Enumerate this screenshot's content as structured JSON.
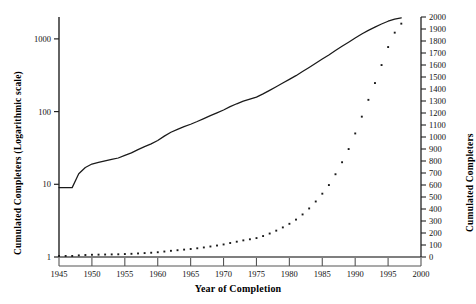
{
  "chart_data": {
    "type": "line",
    "title": "",
    "xlabel": "Year of Completion",
    "ylabel_left": "Cumulated Completers (Logarithmic scale)",
    "ylabel_right": "Cumulated Completers",
    "xlim": [
      1945,
      2000
    ],
    "xticks": [
      1945,
      1950,
      1955,
      1960,
      1965,
      1970,
      1975,
      1980,
      1985,
      1990,
      1995,
      2000
    ],
    "xticklabels": [
      "1945",
      "1950",
      "1955",
      "1960",
      "1965",
      "1970",
      "1975",
      "1980",
      "1985",
      "1990",
      "1995",
      "2000"
    ],
    "left_axis": {
      "scale": "log",
      "ylim": [
        1,
        2000
      ],
      "yticks": [
        1,
        10,
        100,
        1000
      ],
      "yticklabels": [
        "1",
        "10",
        "100",
        "1000"
      ]
    },
    "right_axis": {
      "scale": "linear",
      "ylim": [
        0,
        2000
      ],
      "yticks": [
        0,
        100,
        200,
        300,
        400,
        500,
        600,
        700,
        800,
        900,
        1000,
        1100,
        1200,
        1300,
        1400,
        1500,
        1600,
        1700,
        1800,
        1900,
        2000
      ],
      "yticklabels": [
        "0",
        "100",
        "200",
        "300",
        "400",
        "500",
        "600",
        "700",
        "800",
        "900",
        "1000",
        "1100",
        "1200",
        "1300",
        "1400",
        "1500",
        "1600",
        "1700",
        "1800",
        "1900",
        "2000"
      ]
    },
    "grid": false,
    "legend": null,
    "series": [
      {
        "name": "Cumulated Completers (log scale, solid line)",
        "style": "line",
        "axis": "left",
        "color": "#1a1a1a",
        "x": [
          1945,
          1946,
          1947,
          1948,
          1949,
          1950,
          1951,
          1952,
          1953,
          1954,
          1955,
          1956,
          1957,
          1958,
          1959,
          1960,
          1961,
          1962,
          1963,
          1964,
          1965,
          1966,
          1967,
          1968,
          1969,
          1970,
          1971,
          1972,
          1973,
          1974,
          1975,
          1976,
          1977,
          1978,
          1979,
          1980,
          1981,
          1982,
          1983,
          1984,
          1985,
          1986,
          1987,
          1988,
          1989,
          1990,
          1991,
          1992,
          1993,
          1994,
          1995,
          1996,
          1997
        ],
        "values": [
          9,
          9,
          9,
          14,
          17,
          19,
          20,
          21,
          22,
          23,
          25,
          27,
          30,
          33,
          36,
          40,
          46,
          52,
          57,
          62,
          67,
          73,
          80,
          88,
          96,
          105,
          117,
          128,
          139,
          148,
          158,
          175,
          196,
          220,
          247,
          277,
          312,
          355,
          405,
          463,
          528,
          600,
          690,
          790,
          900,
          1030,
          1170,
          1310,
          1450,
          1600,
          1750,
          1870,
          1945
        ]
      },
      {
        "name": "Cumulated Completers (linear scale, dotted)",
        "style": "dots",
        "axis": "right",
        "color": "#1a1a1a",
        "x": [
          1945,
          1946,
          1947,
          1948,
          1949,
          1950,
          1951,
          1952,
          1953,
          1954,
          1955,
          1956,
          1957,
          1958,
          1959,
          1960,
          1961,
          1962,
          1963,
          1964,
          1965,
          1966,
          1967,
          1968,
          1969,
          1970,
          1971,
          1972,
          1973,
          1974,
          1975,
          1976,
          1977,
          1978,
          1979,
          1980,
          1981,
          1982,
          1983,
          1984,
          1985,
          1986,
          1987,
          1988,
          1989,
          1990,
          1991,
          1992,
          1993,
          1994,
          1995,
          1996,
          1997
        ],
        "values": [
          9,
          9,
          9,
          14,
          17,
          19,
          20,
          21,
          22,
          23,
          25,
          27,
          30,
          33,
          36,
          40,
          46,
          52,
          57,
          62,
          67,
          73,
          80,
          88,
          96,
          105,
          117,
          128,
          139,
          148,
          158,
          175,
          196,
          220,
          247,
          277,
          312,
          355,
          405,
          463,
          528,
          600,
          690,
          790,
          900,
          1030,
          1170,
          1310,
          1450,
          1600,
          1750,
          1870,
          1945
        ]
      }
    ]
  }
}
